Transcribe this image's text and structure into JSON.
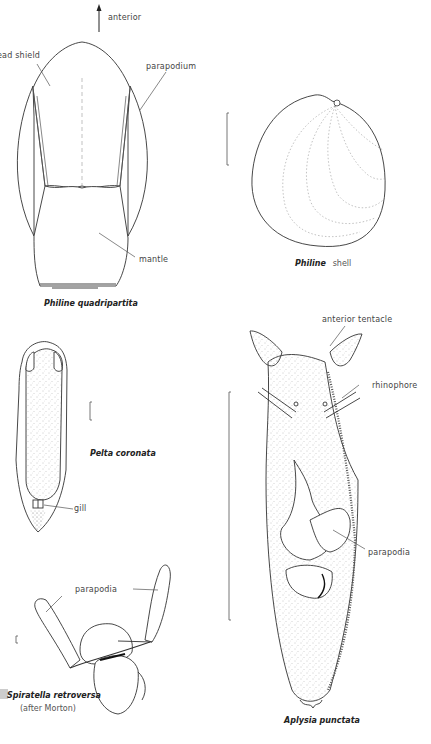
{
  "plate": {
    "figures": [
      {
        "id": "philine-quadripartita",
        "caption": "Philine quadripartita",
        "labels": {
          "orientation": "anterior",
          "head_shield": "ead shield",
          "parapodium": "parapodium",
          "mantle": "mantle"
        }
      },
      {
        "id": "philine-shell",
        "caption_genus": "Philine",
        "caption_rest": "shell"
      },
      {
        "id": "pelta-coronata",
        "caption": "Pelta coronata",
        "labels": {
          "gill": "gill"
        }
      },
      {
        "id": "spiratella-retroversa",
        "caption": "Spiratella retroversa",
        "credit": "(after Morton)",
        "labels": {
          "parapodia": "parapodia"
        }
      },
      {
        "id": "aplysia-punctata",
        "caption": "Aplysia punctata",
        "labels": {
          "anterior_tentacle": "anterior tentacle",
          "rhinophore": "rhinophore",
          "parapodia": "parapodia"
        }
      }
    ]
  }
}
